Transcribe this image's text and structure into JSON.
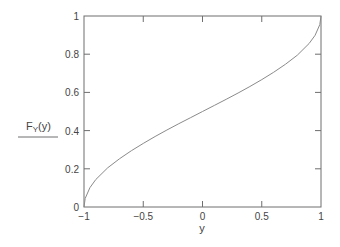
{
  "chart_data": {
    "type": "line",
    "title": "",
    "xlabel": "y",
    "ylabel": "F_Y(y)",
    "ylabel_main": "F",
    "ylabel_sub": "Y",
    "ylabel_arg": "(y)",
    "xlim": [
      -1,
      1
    ],
    "ylim": [
      0,
      1
    ],
    "grid": false,
    "legend": null,
    "x_ticks": [
      -1,
      -0.5,
      0,
      0.5,
      1
    ],
    "x_tick_labels": [
      "−1",
      "−0.5",
      "0",
      "0.5",
      "1"
    ],
    "y_ticks": [
      0,
      0.2,
      0.4,
      0.6,
      0.8,
      1
    ],
    "y_tick_labels": [
      "0",
      "0.2",
      "0.4",
      "0.6",
      "0.8",
      "1"
    ],
    "series": [
      {
        "name": "F_Y(y)",
        "color": "#8a8a8a",
        "x": [
          -1,
          -0.99,
          -0.95,
          -0.9,
          -0.8,
          -0.7,
          -0.6,
          -0.5,
          -0.4,
          -0.3,
          -0.2,
          -0.1,
          0,
          0.1,
          0.2,
          0.3,
          0.4,
          0.5,
          0.6,
          0.7,
          0.8,
          0.9,
          0.95,
          0.99,
          1
        ],
        "values": [
          0,
          0.045,
          0.101,
          0.144,
          0.205,
          0.253,
          0.295,
          0.333,
          0.369,
          0.403,
          0.436,
          0.468,
          0.5,
          0.532,
          0.564,
          0.597,
          0.631,
          0.667,
          0.705,
          0.747,
          0.795,
          0.856,
          0.899,
          0.955,
          1
        ]
      }
    ]
  },
  "colors": {
    "axis": "#6e6e6e",
    "curve": "#8a8a8a",
    "text": "#444444"
  }
}
